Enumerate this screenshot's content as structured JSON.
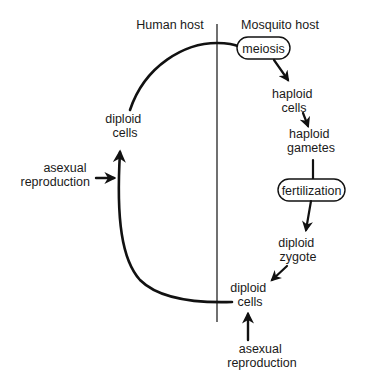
{
  "diagram": {
    "hosts": {
      "left": "Human host",
      "right": "Mosquito host"
    },
    "process_boxes": {
      "meiosis": "meiosis",
      "fertilization": "fertilization"
    },
    "stages": {
      "haploid_cells": [
        "haploid",
        "cells"
      ],
      "haploid_gametes": [
        "haploid",
        "gametes"
      ],
      "diploid_zygote": [
        "diploid",
        "zygote"
      ],
      "diploid_cells_mosquito": [
        "diploid",
        "cells"
      ],
      "diploid_cells_human": [
        "diploid",
        "cells"
      ]
    },
    "inputs": {
      "human_asexual": [
        "asexual",
        "reproduction"
      ],
      "mosquito_asexual": [
        "asexual",
        "reproduction"
      ]
    },
    "colors": {
      "ink": "#111111",
      "background": "#ffffff"
    }
  }
}
